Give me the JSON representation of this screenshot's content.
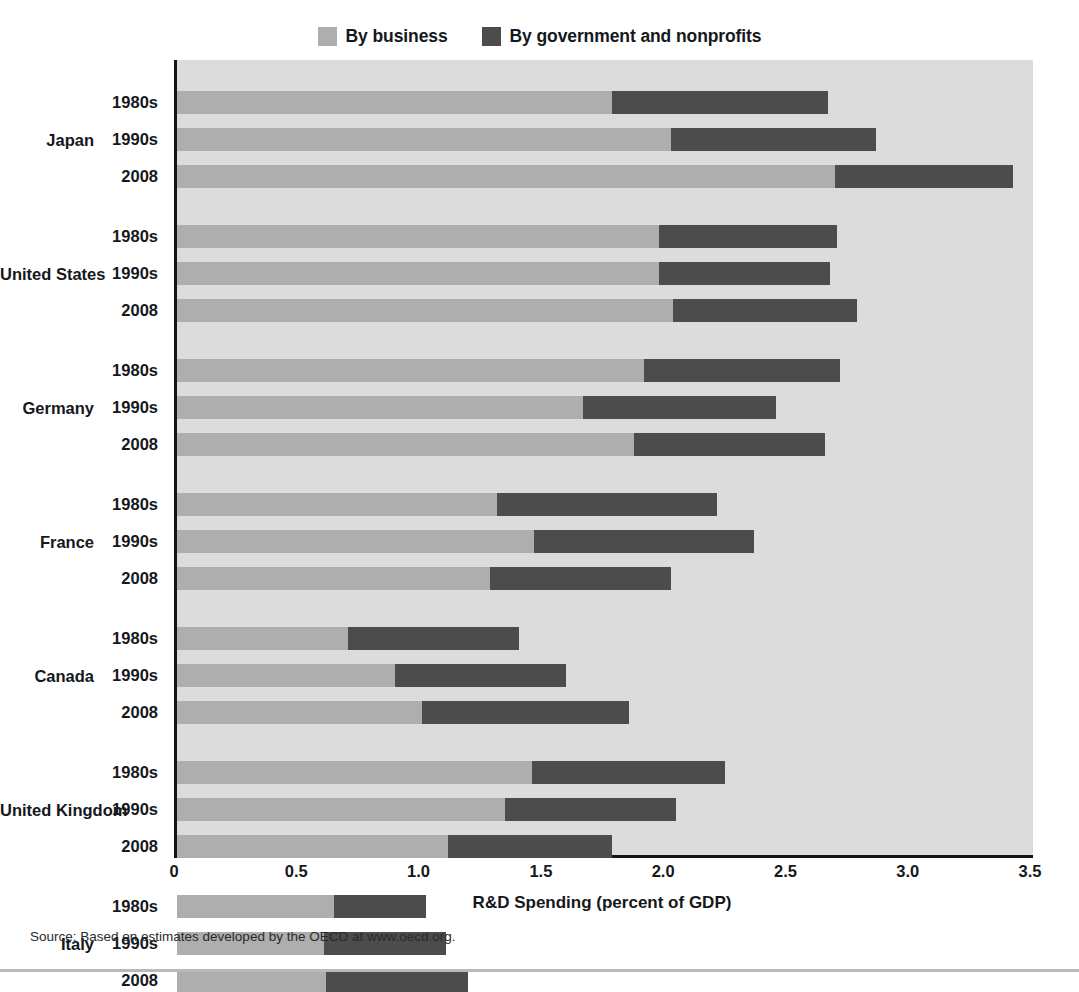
{
  "legend": {
    "entries": [
      {
        "label": "By business",
        "color": "#aeaeae",
        "icon": "legend-swatch-icon"
      },
      {
        "label": "By government and nonprofits",
        "color": "#4c4c4c",
        "icon": "legend-swatch-icon"
      }
    ]
  },
  "axis": {
    "x_title": "R&D Spending (percent of GDP)",
    "ticks": [
      "0",
      "0.5",
      "1.0",
      "1.5",
      "2.0",
      "2.5",
      "3.0",
      "3.5"
    ],
    "tick_values": [
      0,
      0.5,
      1.0,
      1.5,
      2.0,
      2.5,
      3.0,
      3.5
    ],
    "xmin": 0,
    "xmax": 3.5
  },
  "source": "Source: Based on estimates developed by the OECD at www.oecd.org.",
  "colors": {
    "business": "#aeaeae",
    "government": "#4c4c4c",
    "plot_background": "#dcdcdc",
    "axis_line": "#141414",
    "text": "#15181c",
    "page_background": "#ffffff"
  },
  "chart_data": {
    "type": "bar",
    "orientation": "horizontal",
    "stacked": true,
    "title": "",
    "xlabel": "R&D Spending (percent of GDP)",
    "ylabel": "",
    "xlim": [
      0,
      3.5
    ],
    "grid": false,
    "legend_position": "top-center",
    "series": [
      {
        "name": "By business",
        "color": "#aeaeae"
      },
      {
        "name": "By government and nonprofits",
        "color": "#4c4c4c"
      }
    ],
    "groups": [
      {
        "country": "Japan",
        "rows": [
          {
            "period": "1980s",
            "business": 1.78,
            "government": 0.88,
            "total": 2.66
          },
          {
            "period": "1990s",
            "business": 2.02,
            "government": 0.84,
            "total": 2.86
          },
          {
            "period": "2008",
            "business": 2.69,
            "government": 0.73,
            "total": 3.42
          }
        ]
      },
      {
        "country": "United States",
        "rows": [
          {
            "period": "1980s",
            "business": 1.97,
            "government": 0.73,
            "total": 2.7
          },
          {
            "period": "1990s",
            "business": 1.97,
            "government": 0.7,
            "total": 2.67
          },
          {
            "period": "2008",
            "business": 2.03,
            "government": 0.75,
            "total": 2.78
          }
        ]
      },
      {
        "country": "Germany",
        "rows": [
          {
            "period": "1980s",
            "business": 1.91,
            "government": 0.8,
            "total": 2.71
          },
          {
            "period": "1990s",
            "business": 1.66,
            "government": 0.79,
            "total": 2.45
          },
          {
            "period": "2008",
            "business": 1.87,
            "government": 0.78,
            "total": 2.65
          }
        ]
      },
      {
        "country": "France",
        "rows": [
          {
            "period": "1980s",
            "business": 1.31,
            "government": 0.9,
            "total": 2.21
          },
          {
            "period": "1990s",
            "business": 1.46,
            "government": 0.9,
            "total": 2.36
          },
          {
            "period": "2008",
            "business": 1.28,
            "government": 0.74,
            "total": 2.02
          }
        ]
      },
      {
        "country": "Canada",
        "rows": [
          {
            "period": "1980s",
            "business": 0.7,
            "government": 0.7,
            "total": 1.4
          },
          {
            "period": "1990s",
            "business": 0.89,
            "government": 0.7,
            "total": 1.59
          },
          {
            "period": "2008",
            "business": 1.0,
            "government": 0.85,
            "total": 1.85
          }
        ]
      },
      {
        "country": "United Kingdom",
        "rows": [
          {
            "period": "1980s",
            "business": 1.45,
            "government": 0.79,
            "total": 2.24
          },
          {
            "period": "1990s",
            "business": 1.34,
            "government": 0.7,
            "total": 2.04
          },
          {
            "period": "2008",
            "business": 1.11,
            "government": 0.67,
            "total": 1.78
          }
        ]
      },
      {
        "country": "Italy",
        "rows": [
          {
            "period": "1980s",
            "business": 0.64,
            "government": 0.38,
            "total": 1.02
          },
          {
            "period": "1990s",
            "business": 0.6,
            "government": 0.5,
            "total": 1.1
          },
          {
            "period": "2008",
            "business": 0.61,
            "government": 0.58,
            "total": 1.19
          }
        ]
      }
    ]
  }
}
